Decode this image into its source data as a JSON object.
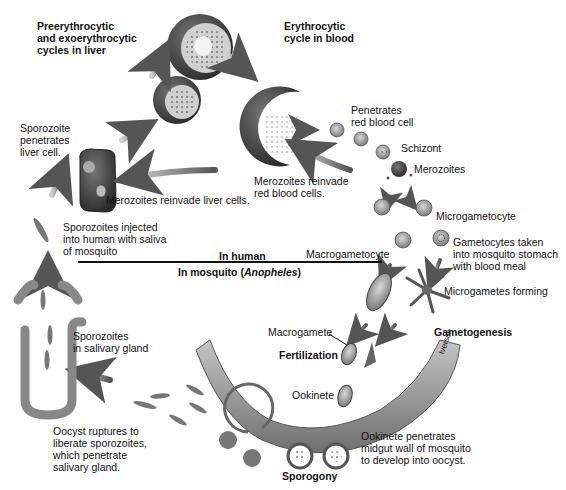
{
  "diagram": {
    "headings": {
      "liver_cycle": "Preerythrocytic\nand exoerythrocytic\ncycles in liver",
      "blood_cycle": "Erythrocytic\ncycle in blood"
    },
    "divider": {
      "top_label": "In human",
      "bottom_label_prefix": "In mosquito (",
      "bottom_label_genus": "Anopheles",
      "bottom_label_suffix": ")"
    },
    "labels": {
      "sporozoite_penetrates": "Sporozoite\npenetrates\nliver cell.",
      "merozoites_reinvade_liver": "Merozoites reinvade liver cells.",
      "merozoites_reinvade_rbc": "Merozoites reinvade\nred blood cells.",
      "penetrates_rbc": "Penetrates\nred blood cell",
      "schizont": "Schizont",
      "merozoites": "Merozoites",
      "microgametocyte": "Microgametocyte",
      "macrogametocyte": "Macrogametocyte",
      "gametocytes_taken": "Gametocytes taken\ninto mosquito stomach\nwith blood meal",
      "microgametes_forming": "Microgametes forming",
      "gametogenesis": "Gametogenesis",
      "macrogamete": "Macrogamete",
      "fertilization": "Fertilization",
      "ookinete": "Ookinete",
      "ookinete_penetrates": "Ookinete penetrates\nmidgut wall of mosquito\nto develop into oocyst.",
      "sporogony": "Sporogony",
      "oocyst_ruptures": "Oocyst ruptures to\nliberate sporozoites,\nwhich penetrate\nsalivary gland.",
      "sporozoites_salivary": "Sporozoites\nin salivary gland",
      "sporozoites_injected": "Sporozoites injected\ninto human with saliva\nof mosquito",
      "artist_signature": "Iverson"
    },
    "colors": {
      "text": "#111111",
      "cell_dark": "#3a3a3a",
      "cell_mid": "#8a8a8a",
      "cell_light": "#c8c8c8",
      "arrow": "#6a6a6a",
      "background": "#ffffff"
    }
  }
}
